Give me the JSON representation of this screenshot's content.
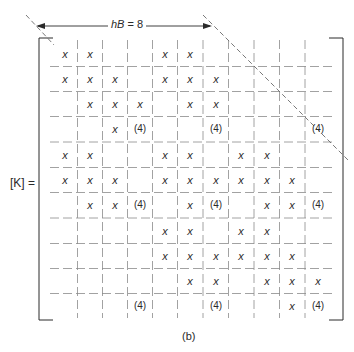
{
  "diagram": {
    "caption": "(b)",
    "matrix_label": "[K] =",
    "matrix_symbol": "K",
    "bandwidth_annotation": {
      "variable": "hB",
      "equals": " = 8",
      "text": "hB = 8"
    },
    "grid": {
      "rows": 11,
      "cols": 11,
      "col_x": [
        65,
        90,
        115,
        140,
        165,
        190,
        216,
        241,
        267,
        292,
        318
      ],
      "row_y": [
        54,
        79,
        104,
        129,
        155,
        180,
        205,
        231,
        256,
        281,
        306
      ]
    },
    "entry_symbols": {
      "nonzero": "x",
      "fill": "(4)"
    },
    "matrix_rows": [
      [
        "x",
        "x",
        "",
        "",
        "x",
        "x",
        "",
        "",
        "",
        "",
        ""
      ],
      [
        "x",
        "x",
        "x",
        "",
        "x",
        "x",
        "x",
        "",
        "",
        "",
        ""
      ],
      [
        "",
        "x",
        "x",
        "x",
        "",
        "x",
        "x",
        "",
        "",
        "",
        ""
      ],
      [
        "",
        "",
        "x",
        "(4)",
        "",
        "",
        "(4)",
        "",
        "",
        "",
        "(4)"
      ],
      [
        "x",
        "x",
        "",
        "",
        "x",
        "x",
        "",
        "x",
        "x",
        "",
        ""
      ],
      [
        "x",
        "x",
        "x",
        "",
        "x",
        "x",
        "x",
        "x",
        "x",
        "x",
        ""
      ],
      [
        "",
        "x",
        "x",
        "(4)",
        "",
        "x",
        "(4)",
        "",
        "x",
        "x",
        "(4)"
      ],
      [
        "",
        "",
        "",
        "",
        "x",
        "x",
        "",
        "x",
        "x",
        "",
        ""
      ],
      [
        "",
        "",
        "",
        "",
        "x",
        "x",
        "x",
        "x",
        "x",
        "x",
        ""
      ],
      [
        "",
        "",
        "",
        "",
        "",
        "x",
        "x",
        "",
        "x",
        "x",
        "x"
      ],
      [
        "",
        "",
        "",
        "(4)",
        "",
        "",
        "(4)",
        "",
        "",
        "x",
        "(4)"
      ]
    ],
    "colors": {
      "ink": "#2a2a2a",
      "grid": "#8a8a8a",
      "background": "#ffffff"
    }
  }
}
